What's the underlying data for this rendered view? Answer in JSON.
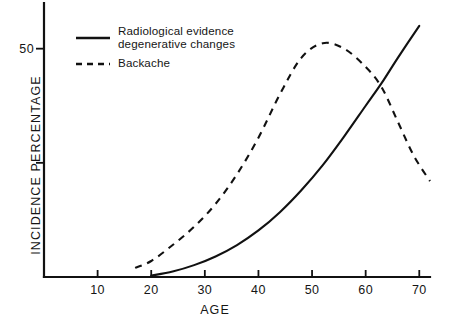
{
  "chart_data": {
    "type": "line",
    "title": "",
    "xlabel": "AGE",
    "ylabel": "INCIDENCE PERCENTAGE",
    "xlim": [
      0,
      72
    ],
    "ylim": [
      0,
      60
    ],
    "grid": false,
    "legend_position": "top-left",
    "xticks": [
      {
        "value": 10,
        "label": "10"
      },
      {
        "value": 20,
        "label": "20"
      },
      {
        "value": 30,
        "label": "30"
      },
      {
        "value": 40,
        "label": "40"
      },
      {
        "value": 50,
        "label": "50"
      },
      {
        "value": 60,
        "label": "60"
      },
      {
        "value": 70,
        "label": "70"
      }
    ],
    "yticks": [
      {
        "value": 25,
        "label": ""
      },
      {
        "value": 50,
        "label": "50"
      }
    ],
    "series": [
      {
        "name": "Radiological evidence degenerative changes",
        "style": "solid",
        "color": "#111111",
        "x": [
          20,
          24,
          28,
          32,
          36,
          40,
          44,
          48,
          52,
          56,
          60,
          63,
          66,
          70
        ],
        "y": [
          0.3,
          1.2,
          2.6,
          4.5,
          7.0,
          10.2,
          14.2,
          19.0,
          24.5,
          30.8,
          37.5,
          42.5,
          48.0,
          55.0
        ]
      },
      {
        "name": "Backache",
        "style": "dashed",
        "color": "#111111",
        "x": [
          17,
          20,
          24,
          28,
          32,
          36,
          40,
          44,
          48,
          52,
          56,
          60,
          63,
          66,
          69,
          72
        ],
        "y": [
          2.0,
          3.5,
          7.0,
          11.0,
          16.0,
          22.5,
          30.5,
          40.0,
          48.0,
          51.2,
          50.0,
          46.0,
          41.5,
          34.0,
          26.5,
          21.0
        ]
      }
    ]
  },
  "legend": {
    "entries": [
      {
        "label": "Radiological evidence\ndegenerative changes",
        "style": "solid"
      },
      {
        "label": "Backache",
        "style": "dashed"
      }
    ]
  },
  "axes": {
    "x_label": "AGE",
    "y_label": "INCIDENCE PERCENTAGE",
    "x_tick_labels": [
      "10",
      "20",
      "30",
      "40",
      "50",
      "60",
      "70"
    ],
    "y_tick_labels": [
      "50"
    ]
  }
}
